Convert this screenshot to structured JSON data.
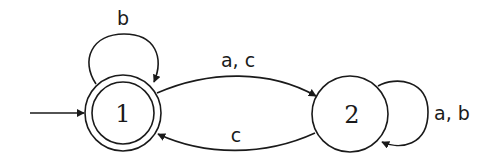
{
  "diagram": {
    "type": "finite-automaton",
    "states": [
      {
        "id": "1",
        "label": "1",
        "initial": true,
        "accepting": true
      },
      {
        "id": "2",
        "label": "2",
        "initial": false,
        "accepting": false
      }
    ],
    "transitions": [
      {
        "from": "1",
        "to": "1",
        "label": "b"
      },
      {
        "from": "1",
        "to": "2",
        "label": "a, c"
      },
      {
        "from": "2",
        "to": "1",
        "label": "c"
      },
      {
        "from": "2",
        "to": "2",
        "label": "a, b"
      }
    ],
    "colors": {
      "stroke": "#1a1a1a",
      "background": "#ffffff"
    }
  }
}
